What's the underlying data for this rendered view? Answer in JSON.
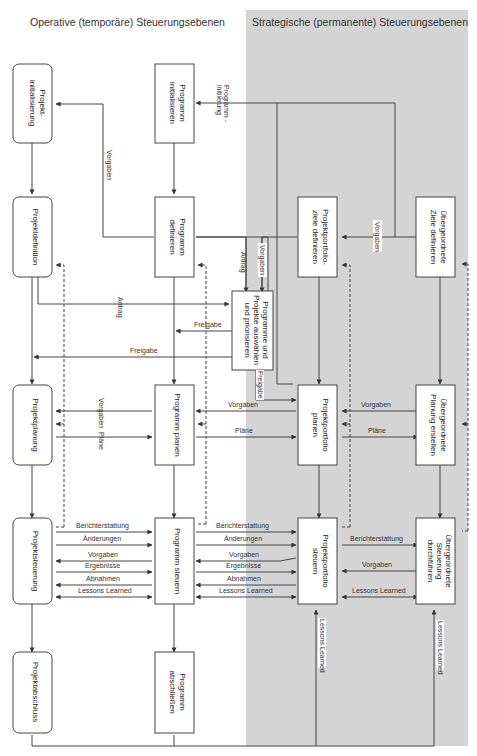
{
  "headers": {
    "operative": "Operative (temporäre) Steuerungsebenen",
    "strategic": "Strategische (permanente) Steuerungsebenen"
  },
  "colors": {
    "strategic_bg": "#d4d4d4",
    "line": "#444444",
    "box_fill": "#ffffff"
  },
  "boxes": {
    "projekt_init": [
      "Projekt-",
      "initialisierung"
    ],
    "programm_init": [
      "Programm",
      "initialisieren"
    ],
    "projektdefinition": [
      "Projektdefinition"
    ],
    "programm_def": [
      "Programm",
      "definieren"
    ],
    "portfolio_ziele": [
      "Projektportfolio-",
      "ziele definieren"
    ],
    "uebergeordnete_ziele": [
      "Übergeordnete",
      "Ziele definieren"
    ],
    "auswaehlen": [
      "Programme und",
      "Projekte auswählen",
      "und priorisieren"
    ],
    "projektplanung": [
      "Projektplanung"
    ],
    "programm_planen": [
      "Programm planen"
    ],
    "portfolio_planen": [
      "Projektportfolio",
      "planen"
    ],
    "uebergeordnete_planung": [
      "Übergeordnete",
      "Planung erstellen"
    ],
    "projektsteuerung": [
      "Projektsteuerung"
    ],
    "programm_steuern": [
      "Programm steuern"
    ],
    "portfolio_steuern": [
      "Projektportfolio",
      "steuern"
    ],
    "uebergeordnete_steuerung": [
      "Übergeordnete",
      "Steuerung",
      "durchführen"
    ],
    "projektabschluss": [
      "Projektabschluss"
    ],
    "programm_abschliessen": [
      "Programm",
      "abschließen"
    ]
  },
  "labels": {
    "programm_initiierung": [
      "Programm -",
      "initiierung"
    ],
    "vorgaben": "Vorgaben",
    "antrag": "Antrag",
    "freigabe": "Freigabe",
    "plaene": "Pläne",
    "berichterstattung": "Berichterstattung",
    "aenderungen": "Änderungen",
    "ergebnisse": "Ergebnisse",
    "abnahmen": "Abnahmen",
    "lessons_learned": "Lessons Learned"
  }
}
